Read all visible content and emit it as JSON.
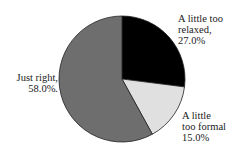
{
  "chart_data": {
    "type": "pie",
    "title": "",
    "slices": [
      {
        "label": "A little too relaxed",
        "value": 27.0,
        "display": "27.0%",
        "color": "#000000"
      },
      {
        "label": "A little too formal",
        "value": 15.0,
        "display": "15.0%",
        "color": "#e0e0e0"
      },
      {
        "label": "Just right",
        "value": 58.0,
        "display": "58.0%",
        "color": "#6e6e6e"
      }
    ],
    "start_angle_deg": 0,
    "direction": "clockwise",
    "legend": "none (direct labels)"
  },
  "labels": {
    "relaxed": {
      "line1": "A little too",
      "line2": "relaxed,",
      "line3": "27.0%"
    },
    "formal": {
      "line1": "A little",
      "line2": "too formal",
      "line3": "15.0%"
    },
    "right": {
      "line1": "Just right,",
      "line2": "58.0%."
    }
  }
}
